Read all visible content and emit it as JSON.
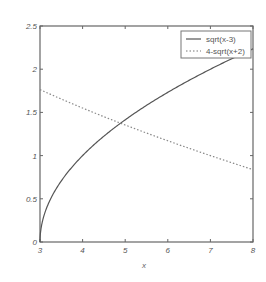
{
  "chart_data": {
    "type": "line",
    "title": "",
    "xlabel": "x",
    "ylabel": "",
    "xlim": [
      3,
      8
    ],
    "ylim": [
      0,
      2.5
    ],
    "xticks": [
      3,
      4,
      5,
      6,
      7,
      8
    ],
    "yticks": [
      0,
      0.5,
      1,
      1.5,
      2,
      2.5
    ],
    "xtick_labels": [
      "3",
      "4",
      "5",
      "6",
      "7",
      "8"
    ],
    "ytick_labels": [
      "0",
      "0.5",
      "1",
      "1.5",
      "2",
      "2.5"
    ],
    "grid": false,
    "legend_position": "upper right",
    "series": [
      {
        "name": "sqrt(x-3)",
        "style": "solid",
        "x": [
          3,
          3.05,
          3.2,
          3.5,
          4,
          4.5,
          5,
          5.5,
          6,
          6.5,
          7,
          7.5,
          8
        ],
        "values": [
          0,
          0.224,
          0.447,
          0.707,
          1.0,
          1.225,
          1.414,
          1.581,
          1.732,
          1.871,
          2.0,
          2.121,
          2.236
        ]
      },
      {
        "name": "4-sqrt(x+2)",
        "style": "dotted",
        "x": [
          3,
          3.5,
          4,
          4.5,
          5,
          5.5,
          6,
          6.5,
          7,
          7.5,
          8
        ],
        "values": [
          1.764,
          1.655,
          1.551,
          1.45,
          1.354,
          1.261,
          1.172,
          1.085,
          1.0,
          0.918,
          0.838
        ]
      }
    ],
    "annotations": []
  },
  "legend": {
    "entries": [
      "sqrt(x-3)",
      "4-sqrt(x+2)"
    ]
  },
  "axes": {
    "xlabel": "x"
  },
  "colors": {
    "line": "#555555",
    "axis": "#666666"
  }
}
